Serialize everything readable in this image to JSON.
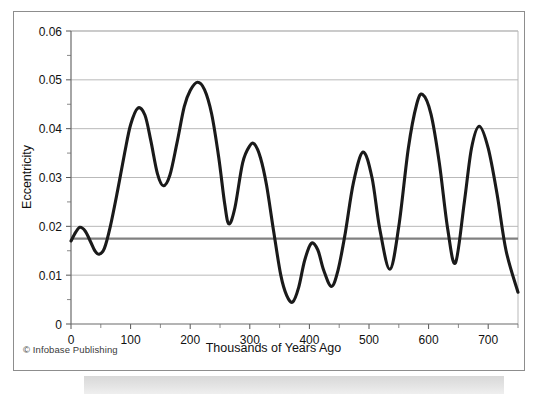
{
  "figure": {
    "credit": "© Infobase Publishing",
    "border_color": "#8d8d8d",
    "background": "#ffffff"
  },
  "chart_data": {
    "type": "line",
    "title": "",
    "xlabel": "Thousands of Years Ago",
    "ylabel": "Eccentricity",
    "xlim": [
      0,
      750
    ],
    "ylim": [
      0,
      0.06
    ],
    "grid": true,
    "legend": false,
    "line_color": "#1a1a1a",
    "line_width": 3.1,
    "reference_line": {
      "value": 0.0175,
      "color": "#808080",
      "width": 2.2,
      "orientation": "horizontal",
      "label": ""
    },
    "x_ticks": [
      0,
      100,
      200,
      300,
      400,
      500,
      600,
      700
    ],
    "x_tick_labels": [
      "0",
      "100",
      "200",
      "300",
      "400",
      "500",
      "600",
      "700"
    ],
    "x_minor_ticks": [
      50,
      150,
      250,
      350,
      450,
      550,
      650,
      750
    ],
    "y_ticks": [
      0,
      0.01,
      0.02,
      0.03,
      0.04,
      0.05,
      0.06
    ],
    "y_tick_labels": [
      "0",
      "0.01",
      "0.02",
      "0.03",
      "0.04",
      "0.05",
      "0.06"
    ],
    "y_minor_ticks": [
      0.005,
      0.015,
      0.025,
      0.035,
      0.045,
      0.055
    ],
    "extrema": [
      {
        "x": 0,
        "y": 0.017,
        "kind": "start"
      },
      {
        "x": 15,
        "y": 0.0198,
        "kind": "peak"
      },
      {
        "x": 47,
        "y": 0.0143,
        "kind": "trough"
      },
      {
        "x": 112,
        "y": 0.0442,
        "kind": "peak"
      },
      {
        "x": 155,
        "y": 0.0283,
        "kind": "trough"
      },
      {
        "x": 212,
        "y": 0.0495,
        "kind": "peak"
      },
      {
        "x": 265,
        "y": 0.0205,
        "kind": "trough"
      },
      {
        "x": 308,
        "y": 0.0368,
        "kind": "peak"
      },
      {
        "x": 372,
        "y": 0.0045,
        "kind": "trough"
      },
      {
        "x": 403,
        "y": 0.0165,
        "kind": "peak"
      },
      {
        "x": 437,
        "y": 0.0077,
        "kind": "trough"
      },
      {
        "x": 490,
        "y": 0.0352,
        "kind": "peak"
      },
      {
        "x": 535,
        "y": 0.0112,
        "kind": "trough"
      },
      {
        "x": 590,
        "y": 0.047,
        "kind": "peak"
      },
      {
        "x": 645,
        "y": 0.0125,
        "kind": "trough"
      },
      {
        "x": 685,
        "y": 0.0405,
        "kind": "peak"
      },
      {
        "x": 750,
        "y": 0.0065,
        "kind": "end"
      }
    ],
    "x": [
      0,
      8,
      15,
      24,
      33,
      40,
      47,
      56,
      66,
      78,
      90,
      100,
      112,
      124,
      134,
      145,
      155,
      166,
      178,
      190,
      200,
      212,
      224,
      236,
      248,
      258,
      265,
      275,
      288,
      300,
      308,
      318,
      328,
      340,
      352,
      362,
      372,
      382,
      392,
      403,
      414,
      424,
      437,
      448,
      460,
      474,
      490,
      505,
      518,
      535,
      550,
      566,
      580,
      590,
      604,
      618,
      632,
      645,
      660,
      672,
      685,
      700,
      715,
      730,
      750
    ],
    "y": [
      0.017,
      0.0188,
      0.0198,
      0.019,
      0.0168,
      0.015,
      0.0143,
      0.0155,
      0.02,
      0.0272,
      0.035,
      0.0408,
      0.0442,
      0.0428,
      0.0375,
      0.0308,
      0.0283,
      0.0305,
      0.0372,
      0.0445,
      0.0478,
      0.0495,
      0.048,
      0.043,
      0.034,
      0.0245,
      0.0205,
      0.0238,
      0.033,
      0.0365,
      0.0368,
      0.034,
      0.0285,
      0.019,
      0.01,
      0.0058,
      0.0045,
      0.0075,
      0.013,
      0.0165,
      0.0152,
      0.011,
      0.0077,
      0.011,
      0.0185,
      0.029,
      0.0352,
      0.03,
      0.0195,
      0.0112,
      0.02,
      0.036,
      0.045,
      0.047,
      0.043,
      0.033,
      0.0195,
      0.0125,
      0.025,
      0.036,
      0.0405,
      0.036,
      0.0265,
      0.015,
      0.0065
    ]
  }
}
